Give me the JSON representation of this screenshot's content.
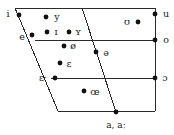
{
  "chart_data": {
    "type": "scatter",
    "title": "",
    "xlabel": "",
    "ylabel": "",
    "axis_note": "Horizontal axis: front to back; Vertical axis: close to open",
    "grid": false,
    "legend": false,
    "xlim": [
      0,
      174
    ],
    "ylim": [
      135,
      0
    ],
    "frame": {
      "top_line": {
        "x1": 15,
        "y1": 8,
        "x2": 155,
        "y2": 8
      },
      "right_line": {
        "x1": 155,
        "y1": 8,
        "x2": 155,
        "y2": 111
      },
      "left_slant": {
        "x1": 15,
        "y1": 8,
        "x2": 58,
        "y2": 111
      },
      "bottom_line": {
        "x1": 58,
        "y1": 111,
        "x2": 155,
        "y2": 111
      },
      "mid_line_high": {
        "x1": 35,
        "y1": 40,
        "x2": 155,
        "y2": 40
      },
      "mid_line_low": {
        "x1": 51,
        "y1": 78,
        "x2": 155,
        "y2": 78
      },
      "center_diagonal": {
        "x1": 82,
        "y1": 8,
        "x2": 116,
        "y2": 112
      }
    },
    "points": [
      {
        "symbol": "i",
        "dot_x": 19,
        "dot_y": 15,
        "label_x": 8,
        "label_y": 14,
        "label_pos": "left"
      },
      {
        "symbol": "y",
        "dot_x": 46,
        "dot_y": 17,
        "label_x": 57,
        "label_y": 17,
        "label_pos": "right"
      },
      {
        "symbol": "ʊ",
        "dot_x": 138,
        "dot_y": 22,
        "label_x": 127,
        "label_y": 22,
        "label_pos": "left"
      },
      {
        "symbol": "u",
        "dot_x": 155,
        "dot_y": 14,
        "label_x": 166,
        "label_y": 14,
        "label_pos": "right"
      },
      {
        "symbol": "e",
        "dot_x": 32,
        "dot_y": 35,
        "label_x": 22,
        "label_y": 37,
        "label_pos": "left"
      },
      {
        "symbol": "ɪ",
        "dot_x": 47,
        "dot_y": 32,
        "label_x": 56,
        "label_y": 32,
        "label_pos": "right"
      },
      {
        "symbol": "ʏ",
        "dot_x": 69,
        "dot_y": 32,
        "label_x": 78,
        "label_y": 32,
        "label_pos": "right"
      },
      {
        "symbol": "o",
        "dot_x": 155,
        "dot_y": 40,
        "label_x": 166,
        "label_y": 40,
        "label_pos": "right"
      },
      {
        "symbol": "ø",
        "dot_x": 64,
        "dot_y": 46,
        "label_x": 73,
        "label_y": 46,
        "label_pos": "right"
      },
      {
        "symbol": "ə",
        "dot_x": 96,
        "dot_y": 52,
        "label_x": 106,
        "label_y": 53,
        "label_pos": "right"
      },
      {
        "symbol": "ɛ",
        "dot_x": 60,
        "dot_y": 63,
        "label_x": 69,
        "label_y": 64,
        "label_pos": "right"
      },
      {
        "symbol": "ɛː",
        "dot_x": 55,
        "dot_y": 78,
        "label_x": 43,
        "label_y": 78,
        "label_pos": "left"
      },
      {
        "symbol": "ɔ",
        "dot_x": 155,
        "dot_y": 78,
        "label_x": 165,
        "label_y": 78,
        "label_pos": "right"
      },
      {
        "symbol": "œ",
        "dot_x": 84,
        "dot_y": 91,
        "label_x": 95,
        "label_y": 92,
        "label_pos": "right"
      },
      {
        "symbol": "a, aː",
        "dot_x": 116,
        "dot_y": 112,
        "label_x": 116,
        "label_y": 125,
        "label_pos": "below"
      }
    ],
    "colors": {
      "line": "#2b2b2b",
      "dot": "#111111",
      "text": "#1a1a1a",
      "background": "#ffffff"
    }
  }
}
